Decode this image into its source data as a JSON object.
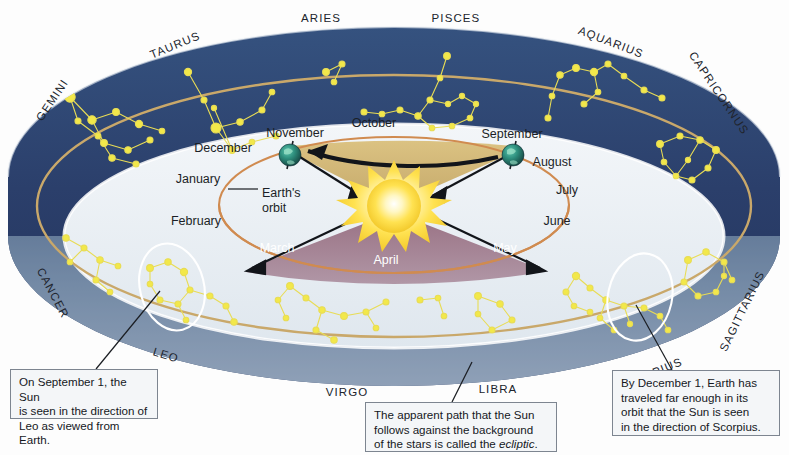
{
  "figure": {
    "colors": {
      "ring_dark": "#2d4370",
      "ring_front": "#9fb4c4",
      "ecliptic_line": "#c9a86a",
      "star": "#f2e84a",
      "orbit": "#d08b50",
      "cone_top": "#c9a961",
      "cone_bottom": "#8d5f72",
      "sun_outer": "#f5d842",
      "sun_core": "#fffdf0",
      "earth": "#2f7a6a",
      "callout_bg": "#f4f6f8",
      "callout_border": "#7d8590",
      "text": "#1b1f26"
    },
    "constellations": [
      {
        "name": "GEMINI",
        "x": 52,
        "y": 100,
        "rot": -56
      },
      {
        "name": "TAURUS",
        "x": 175,
        "y": 45,
        "rot": -22
      },
      {
        "name": "ARIES",
        "x": 321,
        "y": 18,
        "rot": 0
      },
      {
        "name": "PISCES",
        "x": 456,
        "y": 18,
        "rot": 0
      },
      {
        "name": "AQUARIUS",
        "x": 611,
        "y": 42,
        "rot": 21
      },
      {
        "name": "CAPRICORNUS",
        "x": 719,
        "y": 93,
        "rot": 56
      },
      {
        "name": "SAGITTARIUS",
        "x": 742,
        "y": 311,
        "rot": -64
      },
      {
        "name": "SCORPIUS",
        "x": 650,
        "y": 374,
        "rot": -22
      },
      {
        "name": "LIBRA",
        "x": 498,
        "y": 389,
        "rot": 0
      },
      {
        "name": "VIRGO",
        "x": 347,
        "y": 392,
        "rot": 0
      },
      {
        "name": "LEO",
        "x": 166,
        "y": 355,
        "rot": 17
      },
      {
        "name": "CANCER",
        "x": 53,
        "y": 293,
        "rot": 62
      }
    ],
    "months": [
      {
        "name": "September",
        "x": 512,
        "y": 134,
        "on": "white"
      },
      {
        "name": "October",
        "x": 374,
        "y": 123,
        "on": "white"
      },
      {
        "name": "November",
        "x": 295,
        "y": 133,
        "on": "white"
      },
      {
        "name": "December",
        "x": 223,
        "y": 148,
        "on": "white"
      },
      {
        "name": "January",
        "x": 198,
        "y": 179,
        "on": "white"
      },
      {
        "name": "February",
        "x": 196,
        "y": 221,
        "on": "white"
      },
      {
        "name": "March",
        "x": 277,
        "y": 248,
        "on": "cone"
      },
      {
        "name": "April",
        "x": 386,
        "y": 260,
        "on": "cone"
      },
      {
        "name": "May",
        "x": 505,
        "y": 248,
        "on": "cone"
      },
      {
        "name": "June",
        "x": 557,
        "y": 221,
        "on": "white"
      },
      {
        "name": "July",
        "x": 567,
        "y": 190,
        "on": "white"
      },
      {
        "name": "August",
        "x": 552,
        "y": 162,
        "on": "white"
      }
    ],
    "orbit_annotation": {
      "line1": "Earth's",
      "line2": "orbit",
      "x": 262,
      "y": 186
    },
    "callouts": [
      {
        "id": "leo-callout",
        "x": 10,
        "y": 369,
        "w": 148,
        "h": 50,
        "lines": [
          "On September 1, the Sun",
          "is seen in the direction of",
          "Leo as viewed from Earth."
        ]
      },
      {
        "id": "ecliptic-callout",
        "x": 365,
        "y": 402,
        "w": 192,
        "h": 50,
        "lines": [
          "The apparent path that the Sun",
          "follows against the background",
          "of the stars is called the "
        ],
        "italic_tail": "ecliptic",
        "tail_suffix": "."
      },
      {
        "id": "scorpius-callout",
        "x": 612,
        "y": 370,
        "w": 168,
        "h": 66,
        "lines": [
          "By December 1, Earth has",
          "traveled far enough in its",
          "orbit that the Sun is seen",
          "in the direction of Scorpius."
        ]
      }
    ]
  }
}
